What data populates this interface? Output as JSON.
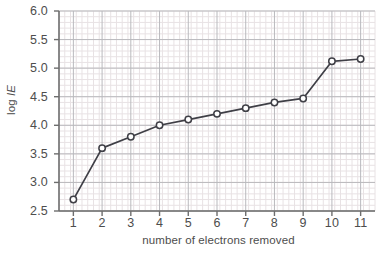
{
  "chart_data": {
    "type": "line",
    "title": "",
    "xlabel": "number of electrons removed",
    "ylabel": "log IE",
    "ylabel_prefix": "log ",
    "ylabel_symbol": "IE",
    "x": [
      1,
      2,
      3,
      4,
      5,
      6,
      7,
      8,
      9,
      10,
      11
    ],
    "values": [
      2.7,
      3.6,
      3.8,
      4.0,
      4.1,
      4.2,
      4.3,
      4.4,
      4.47,
      5.12,
      5.16
    ],
    "series": [
      {
        "name": "log IE",
        "values": [
          2.7,
          3.6,
          3.8,
          4.0,
          4.1,
          4.2,
          4.3,
          4.4,
          4.47,
          5.12,
          5.16
        ]
      }
    ],
    "xlim": [
      0.5,
      11.5
    ],
    "ylim": [
      2.5,
      6.0
    ],
    "xticks": [
      1,
      2,
      3,
      4,
      5,
      6,
      7,
      8,
      9,
      10,
      11
    ],
    "xtick_labels": [
      "1",
      "2",
      "3",
      "4",
      "5",
      "6",
      "7",
      "8",
      "9",
      "10",
      "11"
    ],
    "yticks": [
      2.5,
      3.0,
      3.5,
      4.0,
      4.5,
      5.0,
      5.5,
      6.0
    ],
    "ytick_labels": [
      "2.5",
      "3.0",
      "3.5",
      "4.0",
      "4.5",
      "5.0",
      "5.5",
      "6.0"
    ],
    "grid": true,
    "grid_major_step_x": 1,
    "grid_major_step_y": 0.5,
    "grid_minor_divisions": 5,
    "legend": false,
    "legend_position": "none",
    "marker": "open-circle",
    "colors": {
      "line": "#3f3f46",
      "marker_fill": "#ffffff",
      "marker_stroke": "#3f3f46",
      "axis": "#6e6e6e",
      "grid_major": "#b9b9bd",
      "grid_minor": "#e8e2e4",
      "text": "#4d4d4d",
      "background": "#ffffff"
    }
  }
}
